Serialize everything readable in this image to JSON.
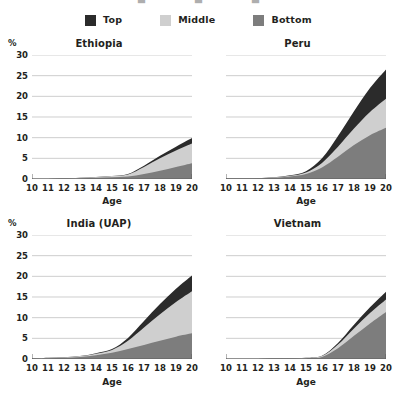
{
  "legend": {
    "items": [
      {
        "label": "Top",
        "color": "#2b2b2b",
        "name": "legend-top"
      },
      {
        "label": "Middle",
        "color": "#cfcfcf",
        "name": "legend-middle"
      },
      {
        "label": "Bottom",
        "color": "#7d7d7d",
        "name": "legend-bottom"
      }
    ]
  },
  "axis": {
    "y_unit": "%",
    "x_title": "Age",
    "y_ticks": [
      "0",
      "5",
      "10",
      "15",
      "20",
      "25",
      "30"
    ],
    "x_ticks": [
      "10",
      "11",
      "12",
      "13",
      "14",
      "15",
      "16",
      "17",
      "18",
      "19",
      "20"
    ]
  },
  "panels": {
    "ethiopia": {
      "title": "Ethiopia"
    },
    "peru": {
      "title": "Peru"
    },
    "india": {
      "title": "India (UAP)"
    },
    "vietnam": {
      "title": "Vietnam"
    }
  },
  "chart_data": {
    "type": "area",
    "stacked": true,
    "title": "",
    "xlabel": "Age",
    "ylabel": "%",
    "xlim": [
      10,
      20
    ],
    "ylim": [
      0,
      30
    ],
    "y_gridlines": [
      0,
      5,
      10,
      15,
      20,
      25,
      30
    ],
    "grid": true,
    "legend_position": "top-center",
    "series_order": [
      "Bottom",
      "Middle",
      "Top"
    ],
    "series_colors": {
      "Top": "#2b2b2b",
      "Middle": "#cfcfcf",
      "Bottom": "#7d7d7d"
    },
    "x": [
      10,
      11,
      12,
      13,
      14,
      15,
      16,
      17,
      18,
      19,
      20
    ],
    "panels": [
      {
        "name": "Ethiopia",
        "series": [
          {
            "name": "Bottom",
            "values": [
              0.0,
              0.0,
              0.1,
              0.2,
              0.3,
              0.4,
              0.6,
              1.2,
              2.0,
              2.9,
              3.8
            ]
          },
          {
            "name": "Middle",
            "values": [
              0.0,
              0.0,
              0.0,
              0.1,
              0.2,
              0.3,
              0.5,
              1.7,
              3.0,
              4.0,
              4.8
            ]
          },
          {
            "name": "Top",
            "values": [
              0.0,
              0.0,
              0.0,
              0.0,
              0.0,
              0.0,
              0.1,
              0.3,
              0.6,
              0.9,
              1.3
            ]
          }
        ],
        "total_at_20": 9.9
      },
      {
        "name": "Peru",
        "series": [
          {
            "name": "Bottom",
            "values": [
              0.1,
              0.1,
              0.2,
              0.3,
              0.6,
              1.2,
              2.8,
              5.4,
              8.2,
              10.6,
              12.4
            ]
          },
          {
            "name": "Middle",
            "values": [
              0.0,
              0.0,
              0.0,
              0.1,
              0.2,
              0.4,
              1.1,
              2.4,
              4.0,
              5.6,
              7.0
            ]
          },
          {
            "name": "Top",
            "values": [
              0.0,
              0.0,
              0.0,
              0.0,
              0.1,
              0.3,
              1.1,
              2.6,
              4.2,
              5.8,
              7.1
            ]
          }
        ],
        "total_at_20": 26.5
      },
      {
        "name": "India (UAP)",
        "series": [
          {
            "name": "Bottom",
            "values": [
              0.1,
              0.2,
              0.3,
              0.5,
              0.9,
              1.5,
              2.4,
              3.4,
              4.4,
              5.4,
              6.2
            ]
          },
          {
            "name": "Middle",
            "values": [
              0.0,
              0.1,
              0.1,
              0.2,
              0.4,
              0.7,
              2.0,
              4.2,
              6.4,
              8.4,
              10.2
            ]
          },
          {
            "name": "Top",
            "values": [
              0.0,
              0.0,
              0.0,
              0.0,
              0.1,
              0.2,
              0.7,
              1.6,
              2.5,
              3.2,
              3.8
            ]
          }
        ],
        "total_at_20": 20.2
      },
      {
        "name": "Vietnam",
        "series": [
          {
            "name": "Bottom",
            "values": [
              0.0,
              0.0,
              0.0,
              0.1,
              0.1,
              0.2,
              0.5,
              2.6,
              5.6,
              8.6,
              11.4
            ]
          },
          {
            "name": "Middle",
            "values": [
              0.0,
              0.0,
              0.0,
              0.0,
              0.0,
              0.1,
              0.2,
              0.9,
              1.8,
              2.5,
              3.0
            ]
          },
          {
            "name": "Top",
            "values": [
              0.0,
              0.0,
              0.0,
              0.0,
              0.0,
              0.0,
              0.1,
              0.4,
              0.9,
              1.4,
              1.9
            ]
          }
        ],
        "total_at_20": 16.3
      }
    ]
  }
}
